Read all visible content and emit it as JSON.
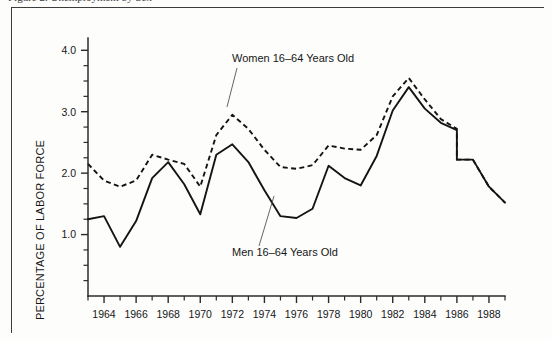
{
  "figure": {
    "caption_cropped": "Figure 2. Unemployment by Sex",
    "frame_color": "#3d3d3d",
    "background_color": "#fdfdfc"
  },
  "chart_data": {
    "type": "line",
    "title": "",
    "xlabel": "",
    "ylabel": "PERCENTAGE OF LABOR FORCE",
    "xlim": [
      1963,
      1989
    ],
    "ylim": [
      0.0,
      4.2
    ],
    "ytick_labels": [
      "1.0",
      "2.0",
      "3.0",
      "4.0"
    ],
    "ytick_values": [
      1.0,
      2.0,
      3.0,
      4.0
    ],
    "y_minor_step": 0.25,
    "xtick_labels": [
      "1964",
      "1966",
      "1968",
      "1970",
      "1972",
      "1974",
      "1976",
      "1978",
      "1980",
      "1982",
      "1984",
      "1986",
      "1988"
    ],
    "xtick_values": [
      1964,
      1966,
      1968,
      1970,
      1972,
      1974,
      1976,
      1978,
      1980,
      1982,
      1984,
      1986,
      1988
    ],
    "x_minor_step": 1,
    "grid": false,
    "legend_position": "inline-annotation",
    "x": [
      1963,
      1964,
      1965,
      1966,
      1967,
      1968,
      1969,
      1970,
      1971,
      1972,
      1973,
      1974,
      1975,
      1976,
      1977,
      1978,
      1979,
      1980,
      1981,
      1982,
      1983,
      1984,
      1985,
      1986,
      1987,
      1988,
      1989
    ],
    "series": [
      {
        "name": "Women 16–64 Years Old",
        "style": "dashed",
        "color": "#141414",
        "values": [
          2.15,
          1.88,
          1.78,
          1.88,
          2.3,
          2.22,
          2.15,
          1.78,
          2.62,
          2.95,
          2.72,
          2.38,
          2.1,
          2.07,
          2.13,
          2.45,
          2.4,
          2.38,
          2.62,
          3.25,
          3.55,
          3.2,
          2.88,
          2.72,
          2.22,
          1.78,
          1.52
        ],
        "break_at": 1986,
        "break_from": 2.72,
        "break_to": 2.22
      },
      {
        "name": "Men 16–64 Years Old",
        "style": "solid",
        "color": "#141414",
        "values": [
          1.25,
          1.3,
          0.8,
          1.22,
          1.92,
          2.18,
          1.82,
          1.33,
          2.3,
          2.47,
          2.18,
          1.72,
          1.3,
          1.27,
          1.42,
          2.12,
          1.92,
          1.8,
          2.28,
          3.02,
          3.4,
          3.05,
          2.82,
          2.7,
          2.22,
          1.78,
          1.52
        ],
        "break_at": 1986,
        "break_from": 2.7,
        "break_to": 2.22
      }
    ],
    "annotations": [
      {
        "label": "Women 16–64 Years Old",
        "text_x": 232,
        "text_y": 62,
        "leader_from_x": 237,
        "leader_from_y": 68,
        "leader_to_x": 227,
        "leader_to_y": 107
      },
      {
        "label": "Men 16–64 Years Old",
        "text_x": 232,
        "text_y": 256,
        "leader_from_x": 259,
        "leader_from_y": 246,
        "leader_to_x": 274,
        "leader_to_y": 196
      }
    ]
  }
}
